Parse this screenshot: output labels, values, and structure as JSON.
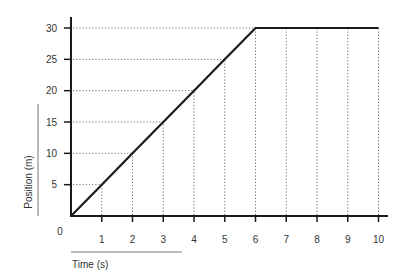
{
  "chart_data": {
    "type": "line",
    "title": "",
    "xlabel": "Time (s)",
    "ylabel": "Position (m)",
    "origin_label": "0",
    "xlim": [
      0,
      10
    ],
    "ylim": [
      0,
      30
    ],
    "x_ticks": [
      1,
      2,
      3,
      4,
      5,
      6,
      7,
      8,
      9,
      10
    ],
    "y_ticks": [
      5,
      10,
      15,
      20,
      25,
      30
    ],
    "grid": "dotted guide lines to data",
    "legend": null,
    "series": [
      {
        "name": "Position",
        "x": [
          0,
          1,
          2,
          3,
          4,
          5,
          6,
          7,
          8,
          9,
          10
        ],
        "values": [
          0,
          5,
          10,
          15,
          20,
          25,
          30,
          30,
          30,
          30,
          30
        ]
      }
    ]
  },
  "colors": {
    "line": "#1a1a1a",
    "axis": "#1a1a1a",
    "guide": "#555555",
    "decor_rule": "#777777",
    "text": "#333333"
  }
}
